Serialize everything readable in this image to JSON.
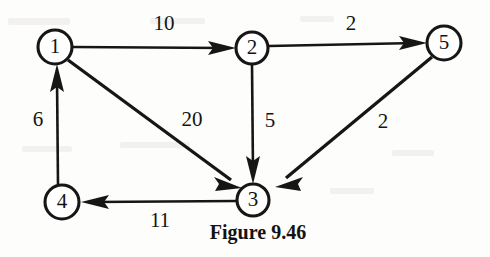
{
  "figure": {
    "caption": "Figure 9.46",
    "caption_x": 258,
    "caption_y": 234,
    "background_color": "#fdfdfc",
    "ink_color": "#161616"
  },
  "graph": {
    "type": "directed-weighted-graph",
    "nodes": [
      {
        "id": "1",
        "label": "1",
        "x": 55,
        "y": 47,
        "r": 17
      },
      {
        "id": "2",
        "label": "2",
        "x": 252,
        "y": 48,
        "r": 16
      },
      {
        "id": "5",
        "label": "5",
        "x": 444,
        "y": 43,
        "r": 17
      },
      {
        "id": "3",
        "label": "3",
        "x": 253,
        "y": 200,
        "r": 16
      },
      {
        "id": "4",
        "label": "4",
        "x": 62,
        "y": 202,
        "r": 17
      }
    ],
    "edges": [
      {
        "id": "e-1-2",
        "from": "1",
        "to": "2",
        "weight": "10",
        "label_x": 164,
        "label_y": 25
      },
      {
        "id": "e-2-5",
        "from": "2",
        "to": "5",
        "weight": "2",
        "label_x": 351,
        "label_y": 25
      },
      {
        "id": "e-1-3",
        "from": "1",
        "to": "3",
        "weight": "20",
        "label_x": 192,
        "label_y": 121
      },
      {
        "id": "e-2-3",
        "from": "2",
        "to": "3",
        "weight": "5",
        "label_x": 270,
        "label_y": 122
      },
      {
        "id": "e-5-3",
        "from": "5",
        "to": "3",
        "weight": "2",
        "label_x": 383,
        "label_y": 123
      },
      {
        "id": "e-4-1",
        "from": "4",
        "to": "1",
        "weight": "6",
        "label_x": 38,
        "label_y": 121
      },
      {
        "id": "e-3-4",
        "from": "3",
        "to": "4",
        "weight": "11",
        "label_x": 160,
        "label_y": 222
      }
    ]
  }
}
